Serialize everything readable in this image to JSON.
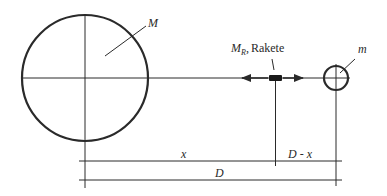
{
  "diagram": {
    "type": "physics-sketch",
    "labels": {
      "earth_mass": "M",
      "rocket_mass": "M",
      "rocket_mass_sub": "R",
      "rocket_sep": ",",
      "rocket_name": "Rakete",
      "moon_mass": "m",
      "dist_x": "x",
      "dist_rest": "D - x",
      "dist_total": "D"
    },
    "colors": {
      "stroke": "#2a2a2a",
      "background": "#ffffff"
    },
    "bodies": [
      {
        "id": "large-body",
        "label_key": "earth_mass",
        "cx": 85,
        "cy": 78,
        "r": 63
      },
      {
        "id": "rocket",
        "label_key": "rocket_name",
        "x": 269,
        "y": 75,
        "w": 13,
        "h": 6
      },
      {
        "id": "small-body",
        "label_key": "moon_mass",
        "cx": 336,
        "cy": 78,
        "r": 12
      }
    ]
  }
}
